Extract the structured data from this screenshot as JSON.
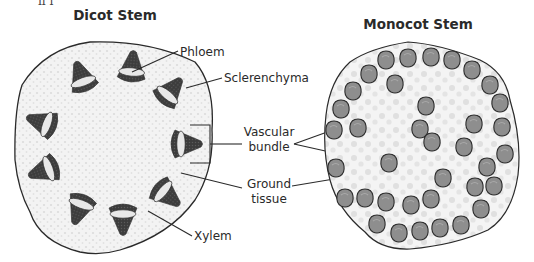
{
  "diagram": {
    "dicot": {
      "title": "Dicot Stem",
      "labels": {
        "phloem": "Phloem",
        "sclerenchyma": "Sclerenchyma",
        "xylem": "Xylem"
      },
      "bundle_count": 10
    },
    "monocot": {
      "title": "Monocot Stem",
      "bundle_count": 40
    },
    "shared_labels": {
      "vascular_line1": "Vascular",
      "vascular_line2": "bundle",
      "ground_line1": "Ground",
      "ground_line2": "tissue"
    },
    "top_cut_text": "ıı  ı",
    "colors": {
      "background": "#ffffff",
      "ground_tissue": "#f2f2f2",
      "ground_dots": "#d8d8d8",
      "outline": "#2a2a2a",
      "dicot_bundle_dark": "#3a3a3a",
      "dicot_bundle_light": "#e6e6e6",
      "monocot_bundle": "#8c8c8c",
      "monocot_bundle_edge": "#2f2f2f",
      "text": "#2a2a2a"
    }
  }
}
